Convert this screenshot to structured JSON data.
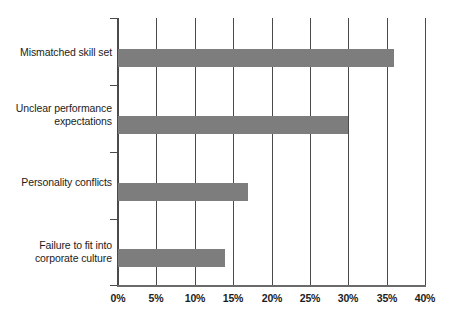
{
  "chart_data": {
    "type": "bar",
    "orientation": "horizontal",
    "title": "",
    "subtitle": "",
    "xlabel": "",
    "ylabel": "",
    "categories": [
      "Mismatched skill set",
      "Unclear performance expectations",
      "Personality conflicts",
      "Failure to fit into corporate culture"
    ],
    "category_lines": [
      [
        "Mismatched skill set"
      ],
      [
        "Unclear performance",
        "expectations"
      ],
      [
        "Personality conflicts"
      ],
      [
        "Failure to fit into",
        "corporate culture"
      ]
    ],
    "values": [
      36,
      30,
      17,
      14
    ],
    "value_unit": "%",
    "xlim": [
      0,
      40
    ],
    "xticks": [
      0,
      5,
      10,
      15,
      20,
      25,
      30,
      35,
      40
    ],
    "xtick_labels": [
      "0%",
      "5%",
      "10%",
      "15%",
      "20%",
      "25%",
      "30%",
      "35%",
      "40%"
    ],
    "grid": "vertical",
    "legend": "none",
    "bar_color": "#7d7d7d",
    "axis_color": "#4a4a4a",
    "background_color": "#ffffff",
    "text_color": "#1c1c1c"
  }
}
